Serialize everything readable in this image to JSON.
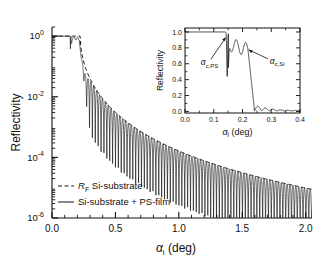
{
  "figure": {
    "background": "#ffffff",
    "line_color": "#111111"
  },
  "chart_data": {
    "type": "line",
    "title": "",
    "xlabel": "αi  (deg)",
    "xlabel_symbol": "α",
    "xlabel_sub": "i",
    "xlabel_unit": "(deg)",
    "ylabel": "Reflectivity",
    "xlim": [
      0.0,
      2.05
    ],
    "ylim": [
      1e-06,
      2.0
    ],
    "yscale": "log",
    "grid": false,
    "xticks": [
      0.0,
      0.5,
      1.0,
      1.5,
      2.0
    ],
    "xticklabels": [
      "0.0",
      "0.5",
      "1.0",
      "1.5",
      "2.0"
    ],
    "yticks": [
      1,
      0.01,
      0.0001,
      1e-06
    ],
    "yticklabels": [
      "10^0",
      "10^-2",
      "10^-4",
      "10^-6"
    ],
    "ytick_mantissa": [
      "10",
      "10",
      "10",
      "10"
    ],
    "ytick_exponent": [
      "0",
      "-2",
      "-4",
      "-6"
    ],
    "legend": {
      "position": "lower-left",
      "entries": [
        {
          "label": "Rғ  Si-substrate",
          "label_main": "R",
          "label_sub": "F",
          "label_rest": "Si-substrate",
          "style": "dashed"
        },
        {
          "label": "Si-substrate + PS-film",
          "style": "solid"
        }
      ]
    },
    "series": [
      {
        "name": "R_F Si-substrate",
        "style": "dashed",
        "comment": "Fresnel reflectivity of bare Si substrate: plateau at 1 up to alpha_c,Si=0.223 deg then ~alpha^-4 decay"
      },
      {
        "name": "Si-substrate + PS-film",
        "style": "solid",
        "comment": "Same envelope modulated by Kiessig fringes from a PS film; fringe spacing ~0.0455 deg"
      }
    ],
    "critical_angles": {
      "alpha_c_PS": 0.145,
      "alpha_c_Si": 0.223
    },
    "fringe_period_deg": 0.0455
  },
  "inset": {
    "xlabel_symbol": "α",
    "xlabel_sub": "i",
    "xlabel_unit": "(deg)",
    "ylabel": "Reflectivity",
    "xlim": [
      0.0,
      0.4
    ],
    "ylim": [
      -0.02,
      1.05
    ],
    "yscale": "linear",
    "grid": false,
    "xticks": [
      0.0,
      0.1,
      0.2,
      0.3,
      0.4
    ],
    "xticklabels": [
      "0.0",
      "0.1",
      "0.2",
      "0.3",
      "0.4"
    ],
    "yticks": [
      0.0,
      0.2,
      0.4,
      0.6,
      0.8,
      1.0
    ],
    "yticklabels": [
      "0.0",
      "0.2",
      "0.4",
      "0.6",
      "0.8",
      "1.0"
    ],
    "annotations": [
      {
        "name": "alpha-c-ps",
        "text_main": "α",
        "text_sub": "c,PS",
        "x": 0.055,
        "y": 0.58,
        "arrow_to_x": 0.142,
        "arrow_to_y": 0.93
      },
      {
        "name": "alpha-c-si",
        "text_main": "α",
        "text_sub": "c,Si",
        "x": 0.295,
        "y": 0.6,
        "arrow_to_x": 0.222,
        "arrow_to_y": 0.775
      }
    ]
  }
}
